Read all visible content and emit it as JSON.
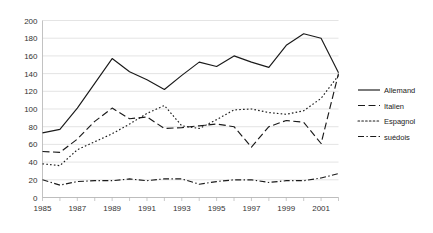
{
  "chart_data": {
    "type": "line",
    "title": "",
    "xlabel": "",
    "ylabel": "",
    "xlim": [
      1985,
      2002
    ],
    "ylim": [
      0,
      200
    ],
    "ytick_step": 20,
    "xtick_step": 1,
    "xtick_label_step": 2,
    "grid": true,
    "legend_position": "right",
    "x": [
      1985,
      1986,
      1987,
      1988,
      1989,
      1990,
      1991,
      1992,
      1993,
      1994,
      1995,
      1996,
      1997,
      1998,
      1999,
      2000,
      2001,
      2002
    ],
    "xtick_labels": [
      "1985",
      "",
      "1987",
      "",
      "1989",
      "",
      "1991",
      "",
      "1993",
      "",
      "1995",
      "",
      "1997",
      "",
      "1999",
      "",
      "2001",
      ""
    ],
    "ytick_labels": [
      "0",
      "20",
      "40",
      "60",
      "80",
      "100",
      "120",
      "140",
      "160",
      "180",
      "200"
    ],
    "series": [
      {
        "name": "Allemand",
        "style": "solid",
        "color": "#1a1a1a",
        "values": [
          73,
          77,
          101,
          129,
          157,
          142,
          133,
          122,
          138,
          153,
          148,
          160,
          153,
          147,
          172,
          185,
          180,
          141
        ]
      },
      {
        "name": "Italien",
        "style": "dashed",
        "color": "#1a1a1a",
        "values": [
          52,
          51,
          66,
          86,
          101,
          89,
          91,
          78,
          79,
          81,
          83,
          80,
          57,
          80,
          87,
          85,
          61,
          140
        ]
      },
      {
        "name": "Espagnol",
        "style": "dotted",
        "color": "#1a1a1a",
        "values": [
          38,
          36,
          54,
          63,
          72,
          83,
          95,
          104,
          81,
          78,
          88,
          99,
          100,
          96,
          94,
          98,
          112,
          138
        ]
      },
      {
        "name": "suédois",
        "style": "dashdot",
        "color": "#1a1a1a",
        "values": [
          20,
          14,
          18,
          19,
          19,
          21,
          19,
          21,
          21,
          15,
          18,
          20,
          20,
          17,
          19,
          19,
          22,
          27
        ]
      }
    ]
  },
  "legend": {
    "items": [
      {
        "label": "Allemand",
        "style": "solid"
      },
      {
        "label": "Italien",
        "style": "dashed"
      },
      {
        "label": "Espagnol",
        "style": "dotted"
      },
      {
        "label": "suédois",
        "style": "dashdot"
      }
    ]
  }
}
